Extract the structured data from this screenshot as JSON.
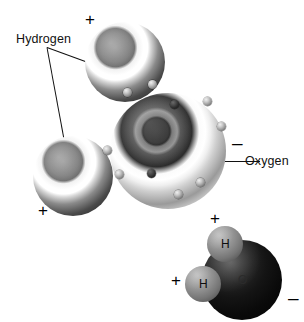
{
  "figure": {
    "title_alt": "Water molecule (H2O) polarity diagram",
    "background_color": "#ffffff",
    "ink_color": "#111111"
  },
  "labels": {
    "hydrogen": "Hydrogen",
    "oxygen": "Oxygen"
  },
  "charges": {
    "hydrogen_top": "+",
    "hydrogen_lower_left": "+",
    "oxygen_negative": "–",
    "inset_hydrogen_top": "+",
    "inset_hydrogen_left": "+",
    "inset_oxygen_negative": "–"
  },
  "atoms": {
    "hydrogen_top": {
      "element": "H",
      "cx": 125,
      "cy": 62,
      "r": 40
    },
    "hydrogen_lower_left": {
      "element": "H",
      "cx": 73,
      "cy": 176,
      "r": 40
    },
    "oxygen": {
      "element": "O",
      "cx": 168,
      "cy": 151,
      "r": 58
    }
  },
  "inset": {
    "caption": "space-filling model",
    "oxygen_symbol": "O",
    "hydrogen_top_symbol": "H",
    "hydrogen_left_symbol": "H"
  },
  "electrons": {
    "count": 10,
    "note": "small spheres on oxygen shells"
  }
}
